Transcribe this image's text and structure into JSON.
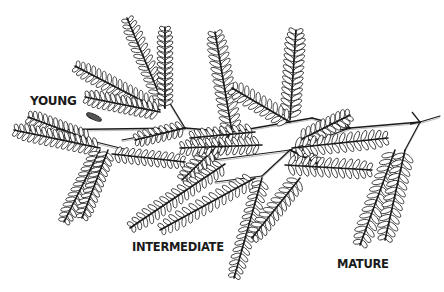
{
  "figure": {
    "labels": {
      "young": "YOUNG",
      "intermediate": "INTERMEDIATE",
      "mature": "MATURE"
    },
    "colors": {
      "ink": "#1a1a1a",
      "leaflet_fill": "#ffffff",
      "background": "#ffffff"
    }
  }
}
